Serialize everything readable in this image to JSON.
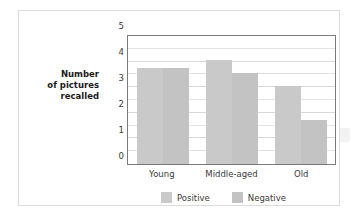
{
  "chart_data": {
    "type": "bar",
    "title": "",
    "xlabel": "",
    "ylabel": "Number of pictures recalled",
    "categories": [
      "Young",
      "Middle-aged",
      "Old"
    ],
    "series": [
      {
        "name": "Positive",
        "values": [
          3.75,
          4.05,
          3.05
        ],
        "color": "#c9c9c9"
      },
      {
        "name": "Negative",
        "values": [
          3.75,
          3.55,
          1.7
        ],
        "color": "#c3c3c3"
      }
    ],
    "ylim": [
      0,
      5
    ],
    "yticks": [
      0,
      1,
      2,
      3,
      4,
      5
    ],
    "ytick_labels": [
      "0",
      "1",
      "2",
      "3",
      "4",
      "5"
    ],
    "minor_gridline_step": 0.5,
    "grid": true,
    "legend_position": "bottom"
  },
  "axis": {
    "y_title_lines": [
      "Number",
      "of pictures",
      "recalled"
    ]
  }
}
